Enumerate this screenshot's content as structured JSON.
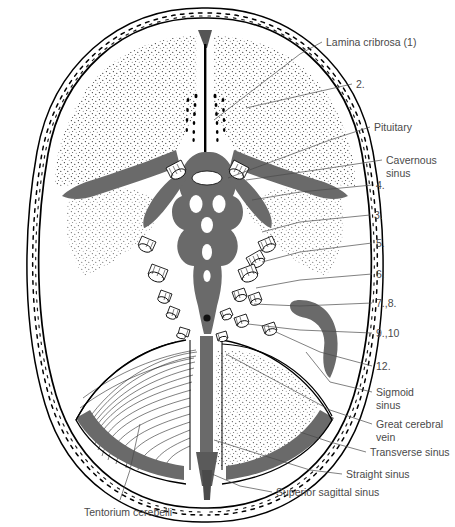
{
  "figure": {
    "background_color": "#ffffff",
    "ink_color": "#000000",
    "sinus_fill_color": "#6a6a6a",
    "label_color": "#4a4a4a"
  },
  "labels": {
    "lamina_cribrosa": "Lamina cribrosa (1)",
    "n2": "2.",
    "pituitary": "Pituitary",
    "cavernous_sinus_line1": "Cavernous",
    "cavernous_sinus_line2": "sinus",
    "n4": "4.",
    "n3": "3.",
    "n5": "5.",
    "n6": "6.",
    "n78": "7.,8.",
    "n910": "9.,10",
    "n12": "12.",
    "sigmoid_sinus_line1": "Sigmoid",
    "sigmoid_sinus_line2": "sinus",
    "great_cerebral_vein_line1": "Great cerebral",
    "great_cerebral_vein_line2": "vein",
    "transverse_sinus": "Transverse sinus",
    "straight_sinus": "Straight sinus",
    "superior_sagittal_sinus": "Superior sagittal sinus",
    "tentorium_cerebelli": "Tentorium cerebelli"
  },
  "label_list": [
    "Lamina cribrosa (1)",
    "2.",
    "Pituitary",
    "Cavernous sinus",
    "4.",
    "3.",
    "5.",
    "6.",
    "7.,8.",
    "9.,10",
    "12.",
    "Sigmoid sinus",
    "Great cerebral vein",
    "Transverse sinus",
    "Straight sinus",
    "Superior sagittal sinus",
    "Tentorium cerebelli"
  ]
}
